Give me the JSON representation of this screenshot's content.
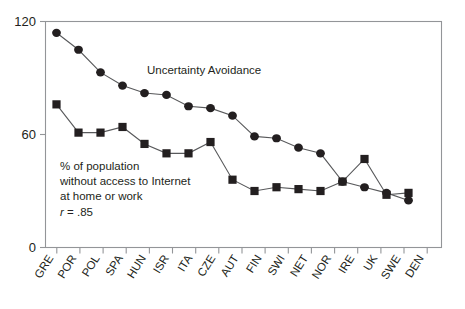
{
  "chart_data": {
    "type": "line",
    "title": "",
    "subtitle": "",
    "xlabel": "",
    "ylabel": "",
    "ylim": [
      0,
      120
    ],
    "yticks": [
      0,
      60,
      120
    ],
    "ytick_labels": [
      "0",
      "60",
      "120"
    ],
    "grid": false,
    "legend_position": "inline-annotations",
    "categories": [
      "GRE",
      "POR",
      "POL",
      "SPA",
      "HUN",
      "ISR",
      "ITA",
      "CZE",
      "AUT",
      "FIN",
      "SWI",
      "NET",
      "NOR",
      "IRE",
      "UK",
      "SWE",
      "DEN"
    ],
    "series": [
      {
        "name": "Uncertainty Avoidance",
        "marker": "circle",
        "values": [
          114,
          105,
          93,
          86,
          82,
          81,
          75,
          74,
          70,
          59,
          58,
          53,
          50,
          35,
          32,
          29,
          25
        ]
      },
      {
        "name": "% of population without access to Internet at home or work",
        "marker": "square",
        "values": [
          76,
          61,
          61,
          64,
          55,
          50,
          50,
          56,
          36,
          30,
          32,
          31,
          30,
          35,
          47,
          28,
          29
        ]
      }
    ],
    "annotations": [
      {
        "name": "uncertainty-avoidance-label",
        "text": "Uncertainty Avoidance"
      },
      {
        "name": "internet-access-label",
        "lines": [
          "% of population",
          "without access to Internet",
          "at home or work"
        ]
      },
      {
        "name": "correlation-label",
        "symbol": "r",
        "text": " = .85"
      }
    ],
    "colors": {
      "marker": "#231f20",
      "line": "#58595b",
      "frame": "#939598",
      "text": "#231f20",
      "background": "#ffffff"
    }
  },
  "axis": {
    "y_label_120": "120",
    "y_label_60": "60",
    "y_label_0": "0"
  },
  "series_labels": {
    "uncertainty_avoidance": "Uncertainty Avoidance"
  },
  "annotation": {
    "line1": "% of population",
    "line2": "without access to Internet",
    "line3": "at home or work",
    "r_symbol": "r",
    "r_value": " = .85"
  },
  "xticks": {
    "t0": "GRE",
    "t1": "POR",
    "t2": "POL",
    "t3": "SPA",
    "t4": "HUN",
    "t5": "ISR",
    "t6": "ITA",
    "t7": "CZE",
    "t8": "AUT",
    "t9": "FIN",
    "t10": "SWI",
    "t11": "NET",
    "t12": "NOR",
    "t13": "IRE",
    "t14": "UK",
    "t15": "SWE",
    "t16": "DEN"
  }
}
